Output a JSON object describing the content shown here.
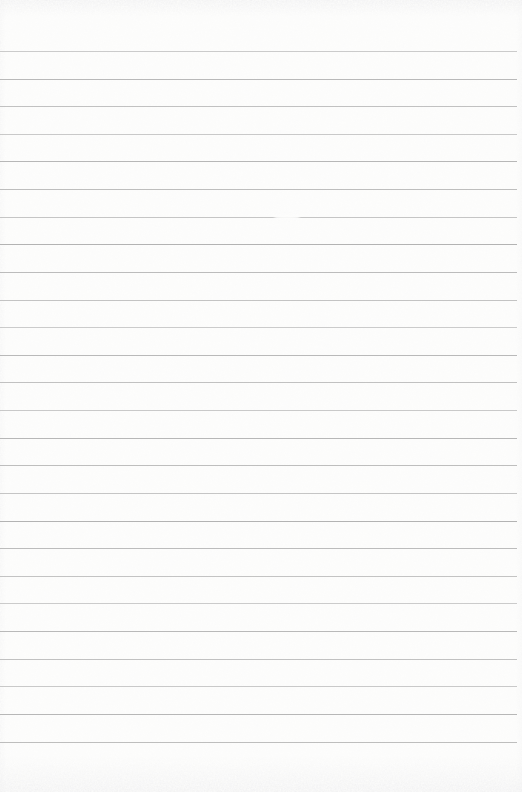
{
  "document": {
    "kind": "scanned blank ruled notebook page",
    "text_content": "",
    "page_background": "#fdfdfc",
    "rule_line_color": "#adadad",
    "scan_noise_color": "#dbdbdb",
    "ruling": {
      "line_count": 26,
      "first_line_y_px": 51,
      "line_spacing_px": 27.62,
      "right_margin_px": 5
    }
  }
}
